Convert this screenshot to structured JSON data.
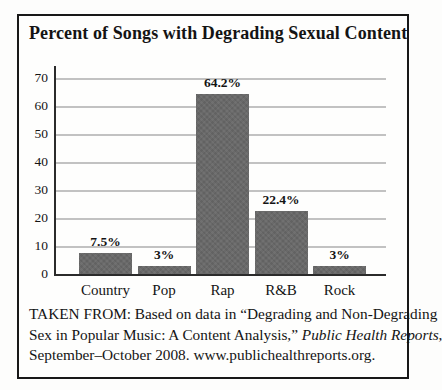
{
  "chart_data": {
    "type": "bar",
    "title": "Percent of Songs with Degrading Sexual Content",
    "categories": [
      "Country",
      "Pop",
      "Rap",
      "R&B",
      "Rock"
    ],
    "values": [
      7.5,
      3,
      64.2,
      22.4,
      3
    ],
    "value_labels": [
      "7.5%",
      "3%",
      "64.2%",
      "22.4%",
      "3%"
    ],
    "xlabel": "",
    "ylabel": "",
    "ylim": [
      0,
      70
    ],
    "yticks": [
      0,
      10,
      20,
      30,
      40,
      50,
      60,
      70
    ],
    "grid": "horizontal",
    "legend": "none",
    "bar_color": "#696969",
    "gridline_color": "#c2c2c2",
    "axis_color": "#2b2b2b"
  },
  "source_note": {
    "lines": [
      [
        {
          "t": "TAKEN FROM: Based on data in “Degrading and Non-Degrading",
          "i": false
        }
      ],
      [
        {
          "t": "Sex in Popular Music: A Content Analysis,” ",
          "i": false
        },
        {
          "t": "Public Health Reports",
          "i": true
        },
        {
          "t": ",",
          "i": false
        }
      ],
      [
        {
          "t": "September–October 2008. www.publichealthreports.org.",
          "i": false
        }
      ]
    ]
  }
}
